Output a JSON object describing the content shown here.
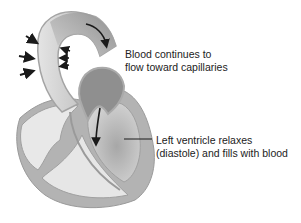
{
  "diagram": {
    "labels": {
      "aorta": {
        "line1": "Blood continues to",
        "line2": "flow toward capillaries"
      },
      "ventricle": {
        "line1": "Left ventricle relaxes",
        "line2": "(diastole) and fills with blood"
      }
    },
    "colors": {
      "outer_wall": "#a8a8a8",
      "wall_fill": "#bdbdbd",
      "chamber_light": "#e6e6e6",
      "chamber_dark": "#8f8f8f",
      "arrow": "#1a1a1a",
      "text": "#222222"
    }
  }
}
